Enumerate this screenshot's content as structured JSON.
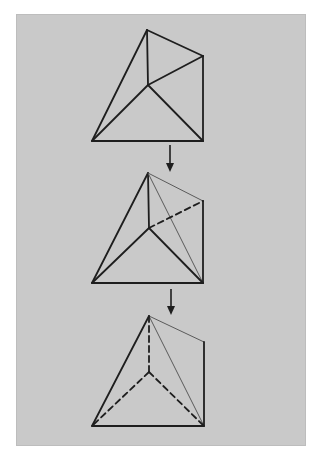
{
  "diagram": {
    "colors": {
      "page_background": "#ffffff",
      "panel_background": "#c9c9c9",
      "line_dark": "#1e1e1e",
      "line_light": "#5a5a5a"
    },
    "figures": [
      {
        "id": "figure-1",
        "step": 1,
        "points": {
          "apex": [
            147,
            30
          ],
          "right_mid": [
            203,
            56
          ],
          "center": [
            148,
            85
          ],
          "bottom_left": [
            92,
            141
          ],
          "bottom_right": [
            203,
            141
          ]
        },
        "edges": [
          {
            "from": "apex",
            "to": "bottom_left",
            "style": "solid-thick"
          },
          {
            "from": "apex",
            "to": "right_mid",
            "style": "solid-thick"
          },
          {
            "from": "apex",
            "to": "center",
            "style": "solid-thick"
          },
          {
            "from": "right_mid",
            "to": "center",
            "style": "solid-thick"
          },
          {
            "from": "right_mid",
            "to": "bottom_right",
            "style": "solid-thick"
          },
          {
            "from": "center",
            "to": "bottom_left",
            "style": "solid-thick"
          },
          {
            "from": "center",
            "to": "bottom_right",
            "style": "solid-thick"
          },
          {
            "from": "bottom_left",
            "to": "bottom_right",
            "style": "solid-thick"
          }
        ]
      },
      {
        "id": "figure-2",
        "step": 2,
        "points": {
          "apex": [
            148,
            173
          ],
          "right_mid": [
            203,
            201
          ],
          "center": [
            149,
            228
          ],
          "bottom_left": [
            92,
            283
          ],
          "bottom_right": [
            203,
            283
          ]
        },
        "edges": [
          {
            "from": "apex",
            "to": "bottom_left",
            "style": "solid-thick"
          },
          {
            "from": "apex",
            "to": "right_mid",
            "style": "solid-thin"
          },
          {
            "from": "apex",
            "to": "center",
            "style": "solid-thick"
          },
          {
            "from": "apex",
            "to": "bottom_right",
            "style": "solid-thin"
          },
          {
            "from": "center",
            "to": "right_mid",
            "style": "dashed"
          },
          {
            "from": "right_mid",
            "to": "bottom_right",
            "style": "solid-thick"
          },
          {
            "from": "center",
            "to": "bottom_left",
            "style": "solid-thick"
          },
          {
            "from": "center",
            "to": "bottom_right",
            "style": "solid-thick"
          },
          {
            "from": "bottom_left",
            "to": "bottom_right",
            "style": "solid-thick"
          }
        ]
      },
      {
        "id": "figure-3",
        "step": 3,
        "points": {
          "apex": [
            149,
            316
          ],
          "right_mid": [
            204,
            342
          ],
          "center": [
            149,
            372
          ],
          "bottom_left": [
            92,
            426
          ],
          "bottom_right": [
            204,
            426
          ]
        },
        "edges": [
          {
            "from": "apex",
            "to": "bottom_left",
            "style": "solid-thick"
          },
          {
            "from": "apex",
            "to": "right_mid",
            "style": "solid-thin"
          },
          {
            "from": "apex",
            "to": "bottom_right",
            "style": "solid-thin"
          },
          {
            "from": "apex",
            "to": "center",
            "style": "dashed"
          },
          {
            "from": "center",
            "to": "bottom_left",
            "style": "dashed"
          },
          {
            "from": "center",
            "to": "bottom_right",
            "style": "dashed"
          },
          {
            "from": "right_mid",
            "to": "bottom_right",
            "style": "solid-thick"
          },
          {
            "from": "bottom_left",
            "to": "bottom_right",
            "style": "solid-thick"
          }
        ]
      }
    ],
    "arrows": [
      {
        "id": "arrow-1",
        "x": 170,
        "y1": 145,
        "y2": 172,
        "direction": "down"
      },
      {
        "id": "arrow-2",
        "x": 171,
        "y1": 289,
        "y2": 315,
        "direction": "down"
      }
    ]
  }
}
